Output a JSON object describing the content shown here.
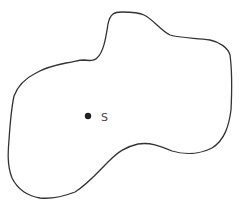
{
  "diagram": {
    "type": "region-with-point",
    "outline_color": "#333333",
    "point_color": "#222222",
    "label_color": "#444444",
    "point": {
      "label": "S",
      "x": 88,
      "y": 116
    }
  }
}
